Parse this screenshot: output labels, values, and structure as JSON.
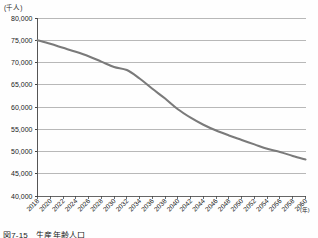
{
  "figure": {
    "caption": "図7-15　生産年齢人口",
    "y_unit_label": "(千人)",
    "x_unit_label": "(年)"
  },
  "chart_data": {
    "type": "line",
    "title": "生産年齢人口",
    "xlabel": "(年)",
    "ylabel": "(千人)",
    "xlim": [
      2018,
      2060
    ],
    "ylim": [
      40000,
      80000
    ],
    "ytick_step": 5000,
    "xtick_step": 2,
    "grid": true,
    "legend": "none",
    "line_color": "#7a7a7a",
    "categories": [
      "2018",
      "2020",
      "2022",
      "2024",
      "2026",
      "2028",
      "2030",
      "2032",
      "2034",
      "2036",
      "2038",
      "2040",
      "2042",
      "2044",
      "2046",
      "2048",
      "2050",
      "2052",
      "2054",
      "2056",
      "2058",
      "2060"
    ],
    "ytick_labels": [
      "80,000",
      "75,000",
      "70,000",
      "65,000",
      "60,000",
      "55,000",
      "50,000",
      "45,000",
      "40,000"
    ],
    "ytick_values": [
      80000,
      75000,
      70000,
      65000,
      60000,
      55000,
      50000,
      45000,
      40000
    ],
    "series": [
      {
        "name": "生産年齢人口",
        "x": [
          2018,
          2020,
          2022,
          2024,
          2026,
          2028,
          2030,
          2032,
          2034,
          2036,
          2038,
          2040,
          2042,
          2044,
          2046,
          2048,
          2050,
          2052,
          2054,
          2056,
          2058,
          2060
        ],
        "values": [
          75000,
          74200,
          73300,
          72400,
          71400,
          70200,
          69000,
          68300,
          66400,
          64100,
          61900,
          59500,
          57600,
          56000,
          54700,
          53600,
          52600,
          51600,
          50600,
          49900,
          49000,
          48200
        ]
      }
    ]
  }
}
